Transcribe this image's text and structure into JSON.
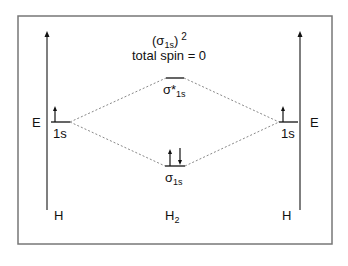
{
  "title": {
    "config_symbol": "σ",
    "config_sub": "1s",
    "config_power": "2",
    "spin_text": "total spin = 0"
  },
  "left_atom": {
    "energy_label": "E",
    "orbital_label": "1s",
    "atom_label": "H",
    "electrons": [
      "up"
    ]
  },
  "right_atom": {
    "energy_label": "E",
    "orbital_label": "1s",
    "atom_label": "H",
    "electrons": [
      "up"
    ]
  },
  "antibonding": {
    "symbol": "σ*",
    "sub": "1s",
    "electrons": []
  },
  "bonding": {
    "symbol": "σ",
    "sub": "1s",
    "electrons": [
      "up",
      "down"
    ]
  },
  "molecule": {
    "label": "H",
    "sub": "2"
  },
  "colors": {
    "frame": "#777777",
    "axis": "#555555",
    "line": "#111111",
    "dotted": "#888888"
  }
}
